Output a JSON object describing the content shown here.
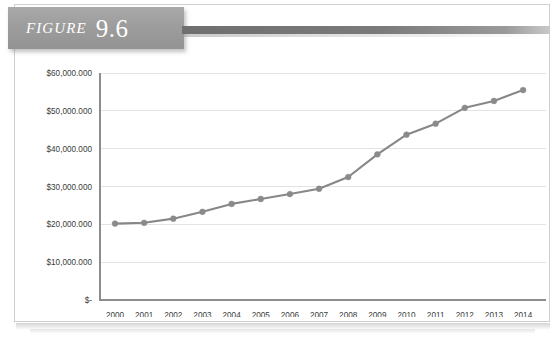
{
  "figure": {
    "label": "FIGURE",
    "number": "9.6"
  },
  "colors": {
    "banner": "#9d9d9d",
    "banner_rule": "#7b7b7b",
    "series": "#878787",
    "marker": "#8a8a8a",
    "gridline": "#e3e3e3",
    "axis": "#8d8d8d",
    "text": "#3b3b3b",
    "page_border": "#cfcfcf"
  },
  "chart_data": {
    "type": "line",
    "title": "",
    "xlabel": "",
    "ylabel": "",
    "categories": [
      "2000",
      "2001",
      "2002",
      "2003",
      "2004",
      "2005",
      "2006",
      "2007",
      "2008",
      "2009",
      "2010",
      "2011",
      "2012",
      "2013",
      "2014"
    ],
    "values": [
      20200000,
      20400000,
      21500000,
      23300000,
      25400000,
      26700000,
      28000000,
      29400000,
      32500000,
      38500000,
      43700000,
      46600000,
      50800000,
      52600000,
      55500000
    ],
    "ylim": [
      0,
      60000000
    ],
    "ytick_values": [
      0,
      10000000,
      20000000,
      30000000,
      40000000,
      50000000,
      60000000
    ],
    "ytick_labels": [
      "$-",
      "$10,000.000",
      "$20,000.000",
      "$30,000.000",
      "$40,000.000",
      "$50,000.000",
      "$60,000.000"
    ],
    "grid": true,
    "legend": false,
    "marker": "circle"
  }
}
